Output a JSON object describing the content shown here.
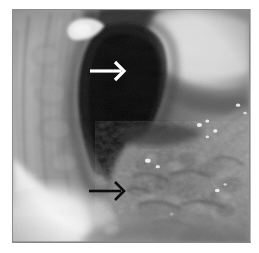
{
  "figure": {
    "domain": "Natural-Image",
    "modality": "endoscopy",
    "rendering": "grayscale",
    "caption": "",
    "alt_text": "Grayscale endoscopic photograph of a luminal organ showing a dark central lumen with an irregular nodular mucosal surface; two arrows indicate findings.",
    "width_px": 259,
    "height_px": 253
  },
  "frame": {
    "border_color": "#8d8d8d",
    "margin_color": "#ffffff",
    "shadow_color": "#7f7f7f",
    "left_px": 12,
    "top_px": 9,
    "width_px": 238,
    "height_px": 234
  },
  "annotations": [
    {
      "id": "arrow-white",
      "name": "white-arrow-marker",
      "shape": "arrow",
      "direction": "right",
      "color": "#ffffff",
      "outline_color": "#000000",
      "tip_x_px": 121,
      "tip_y_px": 70,
      "tail_x_px": 93,
      "tail_y_px": 70,
      "points_at": "dark lumen / narrowed opening"
    },
    {
      "id": "arrow-black",
      "name": "black-arrow-marker",
      "shape": "arrow",
      "direction": "right",
      "color": "#0d0d0d",
      "outline_color": "#ffffff",
      "tip_x_px": 121,
      "tip_y_px": 190,
      "tail_x_px": 92,
      "tail_y_px": 190,
      "points_at": "irregular nodular mucosal lesion"
    }
  ],
  "image_regions": [
    {
      "name": "central-lumen",
      "description": "Dark, nearly black luminal opening running from upper centre down and to the right",
      "tone": "very dark",
      "hex": "#0a0a0a"
    },
    {
      "name": "upper-right-fold",
      "description": "Bright, smooth bulging mucosal fold occupying the upper right quadrant",
      "tone": "bright",
      "hex": "#d8d8d8"
    },
    {
      "name": "left-wall-mucosa",
      "description": "Mid-grey longitudinally folded wall along the left side",
      "tone": "mid grey",
      "hex": "#a7a7a7"
    },
    {
      "name": "nodular-lesion",
      "description": "Coarse, granular, irregular mucosal surface in the lower right with small specular highlights",
      "tone": "mottled mid-dark grey",
      "hex": "#787878"
    },
    {
      "name": "specular-highlight-lower-left",
      "description": "Large blown-out white reflection in the lower left corner",
      "tone": "white",
      "hex": "#ffffff"
    },
    {
      "name": "specular-highlight-upper-left",
      "description": "Small bright reflection near the upper left rim of the lumen",
      "tone": "white",
      "hex": "#f6f6f6"
    }
  ],
  "palette": {
    "black": "#060606",
    "shadow": "#2a2a2a",
    "dark_grey": "#4e4e4e",
    "mid_grey": "#8e8e8e",
    "light_grey": "#c2c2c2",
    "highlight": "#ececec",
    "white": "#ffffff"
  }
}
